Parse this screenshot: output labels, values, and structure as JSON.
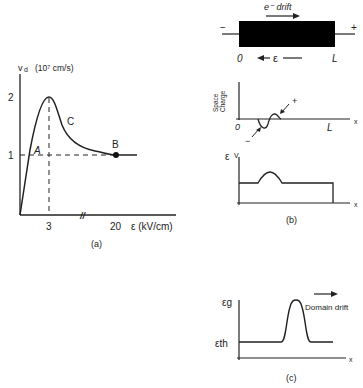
{
  "panel_a": {
    "y_label_sym": "v",
    "y_label_sub": "d",
    "y_label_unit": "(10⁷ cm/s)",
    "y_ticks": [
      "2",
      "1"
    ],
    "x_ticks": [
      "3",
      "20"
    ],
    "x_label": "ε (kV/cm)",
    "point_a": "A",
    "point_b": "B",
    "point_c": "C",
    "break_mark": "//",
    "caption": "(a)"
  },
  "panel_b": {
    "drift_label": "e⁻ drift",
    "minus": "−",
    "plus": "+",
    "start": "0",
    "end": "L",
    "field": "ε",
    "sc_label_1": "Space",
    "sc_label_2": "Charge",
    "sc_origin": "0",
    "sc_end": "L",
    "sc_x": "x",
    "sc_plus": "+",
    "sc_minus": "−",
    "e_label": "ε",
    "e_unit": "V",
    "e_x": "x",
    "caption": "(b)"
  },
  "panel_c": {
    "eg_label": "εg",
    "eth_label": "εth",
    "drift_label": "Domain drift",
    "x_label": "x",
    "caption": "(c)"
  },
  "colors": {
    "ink": "#222222",
    "bar": "#000000",
    "background": "#ffffff"
  }
}
